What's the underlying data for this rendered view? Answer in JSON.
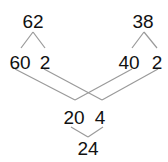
{
  "diagram": {
    "type": "number-decomposition",
    "line_color": "#9a9a9a",
    "text_color": "#111111",
    "nodes": {
      "top_left": "62",
      "top_right": "38",
      "left_tens": "60",
      "left_ones": "2",
      "right_tens": "40",
      "right_ones": "2",
      "tens_sum": "20",
      "ones_sum": "4",
      "total": "24"
    }
  }
}
